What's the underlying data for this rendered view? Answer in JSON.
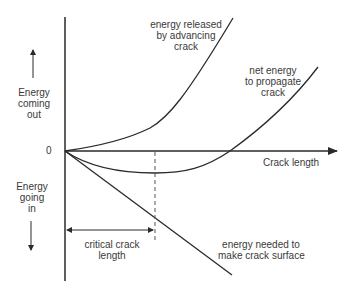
{
  "diagram": {
    "axes": {
      "x_label": "Crack length",
      "origin_label": "0",
      "y_up_label": [
        "Energy",
        "coming",
        "out"
      ],
      "y_down_label": [
        "Energy",
        "going",
        "in"
      ]
    },
    "curves": [
      {
        "id": "released",
        "label": [
          "energy released",
          "by advancing",
          "crack"
        ],
        "shape": "rising quadratic"
      },
      {
        "id": "net",
        "label": [
          "net energy",
          "to propagate",
          "crack"
        ],
        "shape": "dips to minimum at critical length then rises"
      },
      {
        "id": "needed",
        "label": [
          "energy needed to",
          "make crack surface"
        ],
        "shape": "linear decreasing"
      }
    ],
    "annotation": {
      "label": [
        "critical crack",
        "length"
      ],
      "meaning": "crack length at minimum of net energy curve"
    },
    "colors": {
      "line": "#2a2a2a",
      "text": "#3a3a3a",
      "dashed": "#555555"
    }
  }
}
